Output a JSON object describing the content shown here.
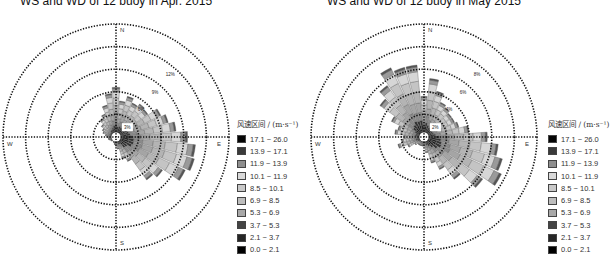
{
  "chart_data": [
    {
      "type": "wind_rose",
      "title": "WS and WD of 12 buoy in Apr. 2015",
      "rings": [
        3,
        6,
        9,
        12,
        15
      ],
      "ring_labels": [
        "3%",
        "6%",
        "9%",
        "12%"
      ],
      "directions_labels": {
        "N": "N",
        "E": "E",
        "S": "S",
        "W": "W"
      },
      "legend_title": "风速区间 / (m·s⁻¹)",
      "speed_bins": [
        "17.1 ~ 26.0",
        "13.9 ~ 17.1",
        "11.9 ~ 13.9",
        "10.1 ~ 11.9",
        "8.5 ~ 10.1",
        "6.9 ~ 8.5",
        "5.3 ~ 6.9",
        "3.7 ~ 5.3",
        "2.1 ~ 3.7",
        "0.0 ~ 2.1"
      ],
      "sector_count": 36,
      "sectors_total_pct": [
        6.6,
        4.8,
        5.6,
        5.0,
        5.4,
        5.2,
        6.6,
        7.2,
        8.0,
        9.5,
        10.6,
        10.8,
        10.2,
        7.6,
        7.0,
        3.6,
        3.0,
        1.6,
        1.2,
        1.0,
        0.8,
        0.6,
        0.6,
        0.8,
        0.8,
        1.0,
        1.0,
        1.2,
        1.4,
        1.8,
        2.0,
        2.4,
        3.0,
        3.4,
        4.4,
        5.8
      ],
      "xlabel": "",
      "ylabel": ""
    },
    {
      "type": "wind_rose",
      "title": "WS and WD of 12 buoy in May 2015",
      "rings": [
        2,
        4,
        6,
        8,
        10
      ],
      "ring_labels": [
        "2%",
        "4%",
        "6%",
        "8%"
      ],
      "directions_labels": {
        "N": "N",
        "E": "E",
        "S": "S",
        "W": "W"
      },
      "legend_title": "风速区间 / (m·s⁻¹)",
      "speed_bins": [
        "17.1 ~ 26.0",
        "13.9 ~ 17.1",
        "11.9 ~ 13.9",
        "10.1 ~ 11.9",
        "8.5 ~ 10.1",
        "6.9 ~ 8.5",
        "5.3 ~ 6.9",
        "3.7 ~ 5.3",
        "2.1 ~ 3.7",
        "0.0 ~ 2.1"
      ],
      "sector_count": 36,
      "sectors_total_pct": [
        3.6,
        5.2,
        4.2,
        3.4,
        3.2,
        3.0,
        3.0,
        3.2,
        4.0,
        5.6,
        6.6,
        7.2,
        7.6,
        6.4,
        4.6,
        3.2,
        2.4,
        1.4,
        0.8,
        0.8,
        0.8,
        0.8,
        0.8,
        1.0,
        1.6,
        2.4,
        2.0,
        1.8,
        2.6,
        2.4,
        3.2,
        4.8,
        5.6,
        6.8,
        6.4,
        6.4
      ],
      "xlabel": "",
      "ylabel": ""
    }
  ],
  "colors": {
    "bins": [
      "#050505",
      "#3a3a3a",
      "#8e8e8e",
      "#d9d9d9",
      "#c8c8c8",
      "#bdbdbd",
      "#a8a8a8",
      "#444444",
      "#262626",
      "#000000"
    ]
  },
  "panels": [
    {
      "title": "WS and WD of 12 buoy in Apr. 2015",
      "legend_title": "风速区间 / (m·s⁻¹)"
    },
    {
      "title": "WS and WD of 12 buoy in May 2015",
      "legend_title": "风速区间 / (m·s⁻¹)"
    }
  ]
}
